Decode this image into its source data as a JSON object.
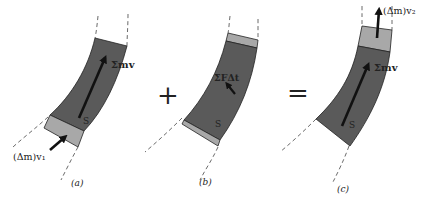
{
  "figure": {
    "panels": [
      {
        "caption": "(a)",
        "labels": {
          "momentum": "Σmv",
          "system": "S",
          "inflow": "(Δm)v₁"
        }
      },
      {
        "caption": "(b)",
        "labels": {
          "impulse": "ΣFΔt",
          "system": "S"
        }
      },
      {
        "caption": "(c)",
        "labels": {
          "momentum": "Σmv",
          "system": "S",
          "outflow": "(Δm)v₂"
        }
      }
    ],
    "operators": {
      "plus": "+",
      "equals": "="
    },
    "colors": {
      "system_fill": "#5a5a5a",
      "mass_element_fill": "#a8a8a8",
      "arrow": "#111111",
      "background": "#ffffff"
    }
  }
}
